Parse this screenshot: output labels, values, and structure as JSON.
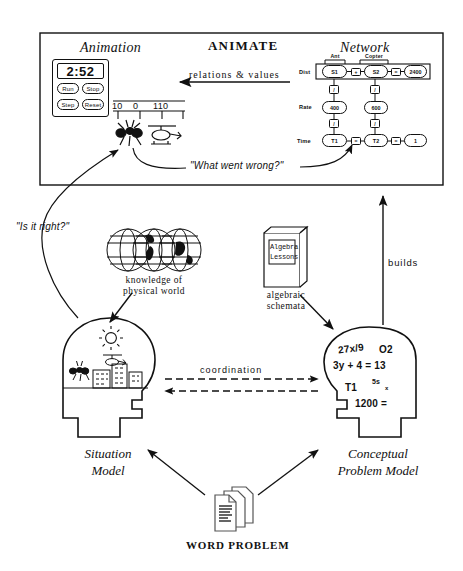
{
  "diagram": {
    "animate_panel": {
      "header": "ANIMATE",
      "left_title": "Animation",
      "right_title": "Network",
      "relation_arrow_label": "relations  &  values",
      "feedback_quote": "\"What went wrong?\"",
      "animation": {
        "timer_value": "2:52",
        "buttons": [
          "Run",
          "Stop",
          "Step",
          "Reset"
        ],
        "number_line_labels": [
          "10",
          "0",
          "110"
        ],
        "actors": [
          "ant",
          "helicopter"
        ]
      },
      "network": {
        "column_headers": [
          "Ant",
          "Copter"
        ],
        "row_labels": [
          "Dist",
          "Rate",
          "Time"
        ],
        "rows": [
          {
            "label": "Dist",
            "nodes": [
              "S1",
              "S2",
              "2400"
            ],
            "operators": [
              "+",
              "="
            ]
          },
          {
            "label": "Rate",
            "nodes": [
              "400",
              "600"
            ],
            "operators": []
          },
          {
            "label": "Time",
            "nodes": [
              "T1",
              "T2",
              "1"
            ],
            "operators": [
              "=",
              "="
            ]
          }
        ],
        "vertical_operators": [
          "/",
          "/",
          "/",
          "/"
        ]
      }
    },
    "verify_quote": "\"Is it right?\"",
    "knowledge_caption_line1": "knowledge of",
    "knowledge_caption_line2": "physical world",
    "book_cover_line1": "Algebra",
    "book_cover_line2": "Lessons",
    "book_caption_line1": "algebraic",
    "book_caption_line2": "schemata",
    "builds_label": "builds",
    "coordination_label": "coordination",
    "situation_model_line1": "Situation",
    "situation_model_line2": "Model",
    "conceptual_model_line1": "Conceptual",
    "conceptual_model_line2": "Problem  Model",
    "word_problem_label": "WORD PROBLEM",
    "equations": [
      {
        "text": "27x/9",
        "size": "normal"
      },
      {
        "text": "O2",
        "size": "normal"
      },
      {
        "text": "3y + 4 = 13",
        "size": "normal"
      },
      {
        "text": "T1",
        "size": "normal"
      },
      {
        "text": "5s",
        "size": "sm"
      },
      {
        "text": "x",
        "size": "xs"
      },
      {
        "text": "1200 =",
        "size": "normal"
      }
    ],
    "situation_head_contents": [
      "sun",
      "ant",
      "helicopter",
      "city-buildings"
    ],
    "colors": {
      "ink": "#111111",
      "paper": "#ffffff"
    }
  }
}
